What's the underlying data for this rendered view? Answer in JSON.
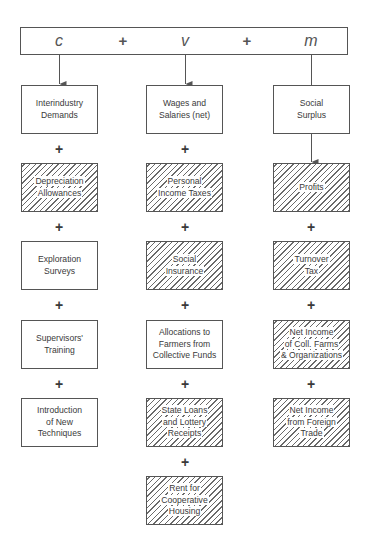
{
  "equation": {
    "terms": [
      "c",
      "v",
      "m"
    ],
    "operators": [
      "+",
      "+"
    ]
  },
  "columns": [
    {
      "id": "c",
      "boxes": [
        {
          "lines": [
            "Interindustry",
            "Demands"
          ],
          "hatched": false
        },
        {
          "lines": [
            "Depreciation",
            "Allowances"
          ],
          "hatched": true
        },
        {
          "lines": [
            "Exploration",
            "Surveys"
          ],
          "hatched": false
        },
        {
          "lines": [
            "Supervisors'",
            "Training"
          ],
          "hatched": false
        },
        {
          "lines": [
            "Introduction",
            "of New",
            "Techniques"
          ],
          "hatched": false
        }
      ]
    },
    {
      "id": "v",
      "boxes": [
        {
          "lines": [
            "Wages and",
            "Salaries (net)"
          ],
          "hatched": false
        },
        {
          "lines": [
            "Personal",
            "Income Taxes"
          ],
          "hatched": true
        },
        {
          "lines": [
            "Social",
            "Insurance"
          ],
          "hatched": true
        },
        {
          "lines": [
            "Allocations to",
            "Farmers from",
            "Collective Funds"
          ],
          "hatched": false
        },
        {
          "lines": [
            "State Loans",
            "and Lottery",
            "Receipts"
          ],
          "hatched": true
        },
        {
          "lines": [
            "Rent for",
            "Cooperative",
            "Housing"
          ],
          "hatched": true
        }
      ]
    },
    {
      "id": "m",
      "boxes": [
        {
          "lines": [
            "Social",
            "Surplus"
          ],
          "hatched": false
        },
        {
          "lines": [
            "Profits"
          ],
          "hatched": true
        },
        {
          "lines": [
            "Turnover",
            "Tax"
          ],
          "hatched": true
        },
        {
          "lines": [
            "Net Income",
            "of Coll. Farms",
            "& Organizations"
          ],
          "hatched": true
        },
        {
          "lines": [
            "Net Income",
            "from Foreign",
            "Trade"
          ],
          "hatched": true
        }
      ]
    }
  ],
  "connector_symbol": "+",
  "m_first_connector": "arrow"
}
